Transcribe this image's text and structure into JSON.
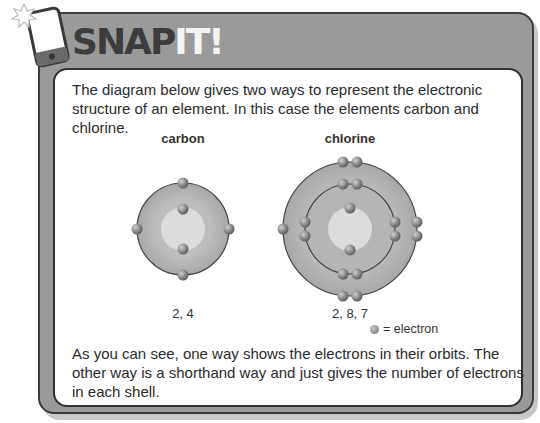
{
  "header": {
    "title_part1": "SNAP",
    "title_part2": "IT!",
    "icon": "phone-camera-icon"
  },
  "intro_text": "The diagram below gives two ways to represent the electronic structure of an element. In this case the elements carbon and chlorine.",
  "diagrams": [
    {
      "element": "carbon",
      "configuration": "2, 4",
      "shells": [
        2,
        4
      ]
    },
    {
      "element": "chlorine",
      "configuration": "2, 8, 7",
      "shells": [
        2,
        8,
        7
      ]
    }
  ],
  "legend": {
    "symbol": "electron-dot",
    "label": "= electron"
  },
  "outro_text": "As you can see, one way shows the electrons in their orbits. The other way is a shorthand way and just gives the number of electrons in each shell.",
  "colors": {
    "frame": "#9a9a9a",
    "border": "#333333",
    "shell_fill": "#b5b5b5",
    "nucleus_fill": "#dcdcdc",
    "electron": "#7a7a7a"
  }
}
